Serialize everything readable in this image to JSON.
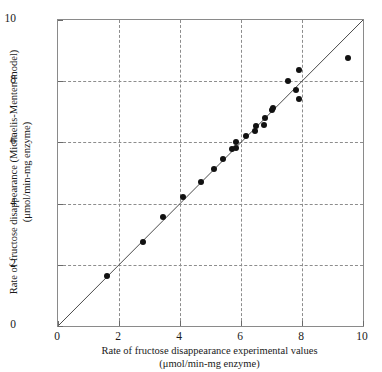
{
  "chart_data": {
    "type": "scatter",
    "title": "",
    "xlabel": "Rate of fructose disappearance experimental values",
    "xlabel_units": "(μmol/min-mg enzyme)",
    "ylabel": "Rate of fructose disappearance (Michaelis-Menten model)",
    "ylabel_units": "(μmol/min-mg enzyme)",
    "xlim": [
      0,
      10
    ],
    "ylim": [
      0,
      10
    ],
    "xticks": [
      "0",
      "2",
      "4",
      "6",
      "8",
      "10"
    ],
    "ytick_values": [
      0,
      2,
      4,
      6,
      8,
      10
    ],
    "yticks": [
      "0",
      "2",
      "4",
      "6",
      "8",
      "10"
    ],
    "xtick_values": [
      0,
      2,
      4,
      6,
      8,
      10
    ],
    "grid": true,
    "gridlines_x": [
      2,
      4,
      6,
      8
    ],
    "gridlines_y": [
      2,
      4,
      6,
      8
    ],
    "legend": null,
    "marker": "filled-circle",
    "marker_color": "#111111",
    "reference_line": {
      "name": "1:1 parity line",
      "from": [
        0,
        0
      ],
      "to": [
        10,
        10
      ],
      "color": "#4a4a4a"
    },
    "points": [
      {
        "x": 1.6,
        "y": 1.64
      },
      {
        "x": 2.8,
        "y": 2.75
      },
      {
        "x": 3.45,
        "y": 3.55
      },
      {
        "x": 4.1,
        "y": 4.2
      },
      {
        "x": 4.7,
        "y": 4.7
      },
      {
        "x": 5.1,
        "y": 5.12
      },
      {
        "x": 5.4,
        "y": 5.45
      },
      {
        "x": 5.7,
        "y": 5.78
      },
      {
        "x": 5.85,
        "y": 6.0
      },
      {
        "x": 5.85,
        "y": 5.82
      },
      {
        "x": 6.15,
        "y": 6.2
      },
      {
        "x": 6.45,
        "y": 6.38
      },
      {
        "x": 6.5,
        "y": 6.55
      },
      {
        "x": 6.75,
        "y": 6.57
      },
      {
        "x": 6.8,
        "y": 6.8
      },
      {
        "x": 7.0,
        "y": 7.05
      },
      {
        "x": 7.05,
        "y": 7.12
      },
      {
        "x": 7.55,
        "y": 8.02
      },
      {
        "x": 7.8,
        "y": 7.72
      },
      {
        "x": 7.9,
        "y": 8.38
      },
      {
        "x": 7.9,
        "y": 7.42
      },
      {
        "x": 9.5,
        "y": 8.75
      }
    ]
  },
  "axes": {
    "y_title_line1": "Rate of fructose disappearance (Michaelis-Menten model)",
    "y_title_line2": "(μmol/min-mg enzyme)",
    "x_title_line1": "Rate of fructose disappearance experimental values",
    "x_title_line2": "(μmol/min-mg enzyme)"
  },
  "colors": {
    "marker": "#111111",
    "grid": "#8d8d8d",
    "frame": "#8a8a8a",
    "line": "#4a4a4a",
    "text": "#1a1a1a",
    "background": "#ffffff"
  }
}
